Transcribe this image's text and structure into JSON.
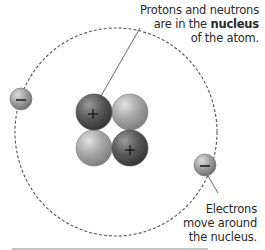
{
  "labels": {
    "nucleus_line1": "Protons and neutrons",
    "nucleus_line2_prefix": "are in the ",
    "nucleus_line2_bold": "nucleus",
    "nucleus_line3": "of the atom.",
    "electrons_line1": "Electrons",
    "electrons_line2": "move around",
    "electrons_line3": "the nucleus."
  },
  "particles": {
    "proton_symbol": "+",
    "electron_symbol": "−",
    "nucleus": [
      {
        "type": "proton",
        "position": "top-left"
      },
      {
        "type": "neutron",
        "position": "top-right"
      },
      {
        "type": "neutron",
        "position": "bottom-left"
      },
      {
        "type": "proton",
        "position": "bottom-right"
      }
    ],
    "electrons": [
      {
        "position": "left"
      },
      {
        "position": "right"
      }
    ]
  },
  "colors": {
    "proton": "#4a4a4a",
    "neutron": "#a0a0a0",
    "electron": "#9a9a9a",
    "orbit": "#555555",
    "text": "#2a2a2a"
  }
}
